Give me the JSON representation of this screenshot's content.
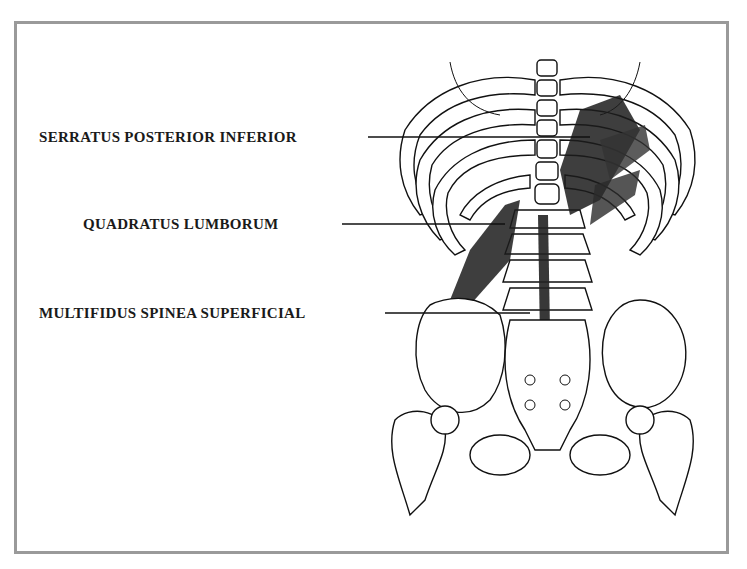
{
  "diagram": {
    "type": "anatomical-illustration",
    "frame_color": "#9a9a9a",
    "ink_color": "#111111",
    "labels": [
      {
        "text": "SERRATUS POSTERIOR INFERIOR",
        "x": 39,
        "y": 131,
        "line": {
          "x1": 368,
          "x2": 590,
          "y": 137
        }
      },
      {
        "text": "QUADRATUS LUMBORUM",
        "x": 83,
        "y": 218,
        "line": {
          "x1": 342,
          "x2": 505,
          "y": 224
        }
      },
      {
        "text": "MULTIFIDUS SPINEA SUPERFICIAL",
        "x": 39,
        "y": 307,
        "line": {
          "x1": 385,
          "x2": 530,
          "y": 313
        }
      }
    ]
  }
}
